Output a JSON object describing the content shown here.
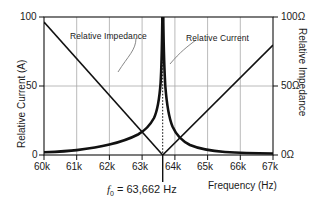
{
  "chart_data": {
    "type": "line",
    "title": "",
    "xlabel": "Frequency (Hz)",
    "ylabel": "Relative Current (A)",
    "y2label": "Relative Impedance",
    "xlim": [
      60000,
      67000
    ],
    "ylim": [
      0,
      100
    ],
    "y2lim": [
      0,
      100
    ],
    "grid": true,
    "legend_position": "inline-annotations",
    "xticks": [
      "60k",
      "61k",
      "62k",
      "63k",
      "64k",
      "65k",
      "66k",
      "67k"
    ],
    "xtick_values": [
      60000,
      61000,
      62000,
      63000,
      64000,
      65000,
      66000,
      67000
    ],
    "yticks": [
      "0",
      "50",
      "100"
    ],
    "ytick_values": [
      0,
      50,
      100
    ],
    "y2ticks": [
      "0Ω",
      "50Ω",
      "100Ω"
    ],
    "y2tick_values": [
      0,
      50,
      100
    ],
    "resonance_frequency": 63662,
    "annotations": [
      {
        "name": "resonance-marker",
        "text": "f₀ = 63,662 Hz",
        "x": 63662
      },
      {
        "name": "impedance-label",
        "text": "Relative Impedance"
      },
      {
        "name": "current-label",
        "text": "Relative Current"
      }
    ],
    "series": [
      {
        "name": "Relative Impedance (resonance peak)",
        "axis": "right",
        "style": "thick",
        "x": [
          60000,
          60500,
          61000,
          61500,
          62000,
          62500,
          62900,
          63200,
          63400,
          63550,
          63640,
          63662,
          63690,
          63800,
          63950,
          64200,
          64600,
          65100,
          65700,
          66300,
          67000
        ],
        "values": [
          2,
          2.3,
          2.8,
          3.5,
          4.6,
          6.6,
          9.2,
          14.5,
          24,
          46,
          88,
          100,
          86,
          40,
          22,
          13,
          8.2,
          5.3,
          3.6,
          2.7,
          2.1
        ]
      },
      {
        "name": "Relative Current (V-dip)",
        "axis": "left",
        "style": "thin",
        "x": [
          60000,
          63662,
          67000
        ],
        "values": [
          96,
          0,
          80
        ]
      }
    ]
  },
  "axes": {
    "left": {
      "name": "Relative Current (A)"
    },
    "right": {
      "name": "Relative Impedance"
    },
    "bottom": {
      "name": "Frequency (Hz)"
    }
  }
}
